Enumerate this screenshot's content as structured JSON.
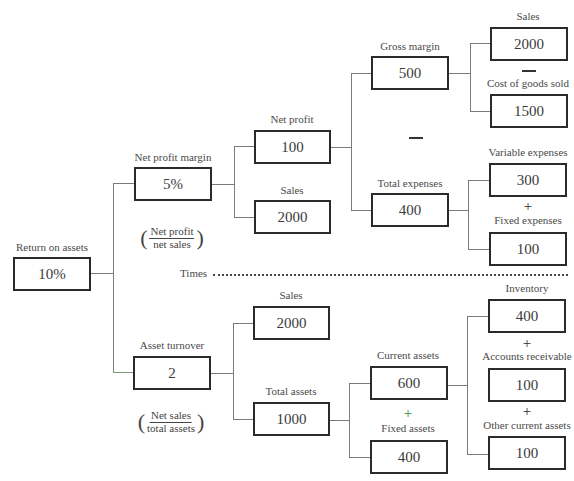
{
  "diagram": {
    "nodes": {
      "roa": {
        "label": "Return on assets",
        "value": "10%"
      },
      "npm": {
        "label": "Net profit margin",
        "value": "5%",
        "formula_num": "Net profit",
        "formula_den": "net sales"
      },
      "net_profit": {
        "label": "Net profit",
        "value": "100"
      },
      "sales_upper": {
        "label": "Sales",
        "value": "2000"
      },
      "gross_margin": {
        "label": "Gross margin",
        "value": "500"
      },
      "sales_top": {
        "label": "Sales",
        "value": "2000"
      },
      "cogs": {
        "label": "Cost of goods sold",
        "value": "1500"
      },
      "total_expenses": {
        "label": "Total expenses",
        "value": "400"
      },
      "variable_expenses": {
        "label": "Variable expenses",
        "value": "300"
      },
      "fixed_expenses": {
        "label": "Fixed expenses",
        "value": "100"
      },
      "asset_turnover": {
        "label": "Asset turnover",
        "value": "2",
        "formula_num": "Net sales",
        "formula_den": "total assets"
      },
      "sales_lower": {
        "label": "Sales",
        "value": "2000"
      },
      "total_assets": {
        "label": "Total assets",
        "value": "1000"
      },
      "current_assets": {
        "label": "Current assets",
        "value": "600"
      },
      "fixed_assets": {
        "label": "Fixed assets",
        "value": "400"
      },
      "inventory": {
        "label": "Inventory",
        "value": "400"
      },
      "accounts_receivable": {
        "label": "Accounts receivable",
        "value": "100"
      },
      "other_current_assets": {
        "label": "Other current assets",
        "value": "100"
      }
    },
    "operators": {
      "plus": "+",
      "times_label": "Times"
    },
    "colors": {
      "box_border": "#2b2b2b",
      "connector": "#7a7a7a",
      "green_plus": "#2e8b3a"
    }
  }
}
